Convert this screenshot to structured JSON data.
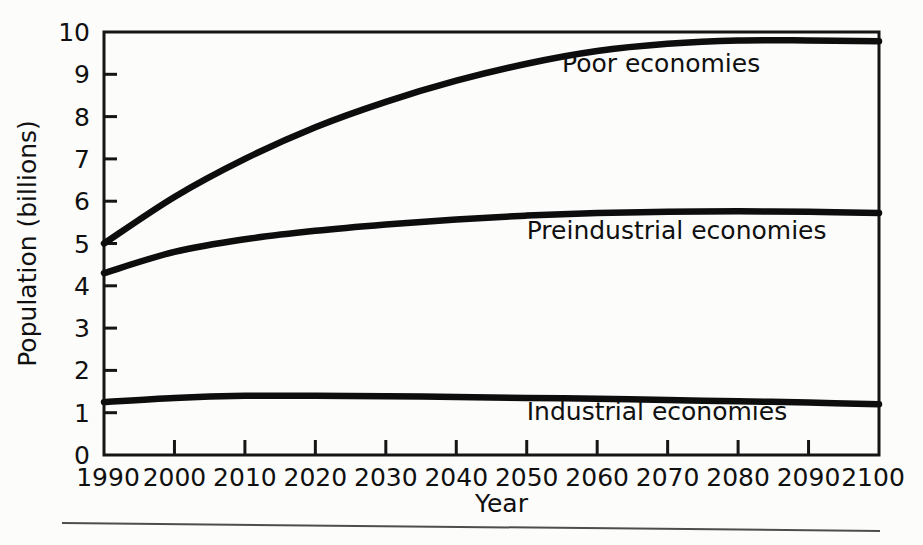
{
  "chart_data": {
    "type": "line",
    "title": "",
    "xlabel": "Year",
    "ylabel": "Population (billions)",
    "xlim": [
      1990,
      2100
    ],
    "ylim": [
      0,
      10
    ],
    "grid": false,
    "legend_position": "inline-right",
    "x_ticks": [
      "1990",
      "2000",
      "2010",
      "2020",
      "2030",
      "2040",
      "2050",
      "2060",
      "2070",
      "2080",
      "2090",
      "2100"
    ],
    "y_ticks": [
      "0",
      "1",
      "2",
      "3",
      "4",
      "5",
      "6",
      "7",
      "8",
      "9",
      "10"
    ],
    "x": [
      1990,
      2000,
      2010,
      2020,
      2030,
      2040,
      2050,
      2060,
      2070,
      2080,
      2090,
      2100
    ],
    "series": [
      {
        "name": "Poor economies",
        "values": [
          5.0,
          6.1,
          7.0,
          7.75,
          8.35,
          8.85,
          9.25,
          9.55,
          9.72,
          9.8,
          9.8,
          9.78
        ]
      },
      {
        "name": "Preindustrial economies",
        "values": [
          4.3,
          4.8,
          5.1,
          5.3,
          5.45,
          5.57,
          5.66,
          5.72,
          5.75,
          5.76,
          5.75,
          5.72
        ]
      },
      {
        "name": "Industrial economies",
        "values": [
          1.25,
          1.35,
          1.4,
          1.4,
          1.39,
          1.37,
          1.35,
          1.33,
          1.3,
          1.27,
          1.24,
          1.2
        ]
      }
    ],
    "colors": {
      "line": "#0d0d0d",
      "axis": "#151515",
      "background": "#fcfcfb"
    },
    "annotations": [
      {
        "text": "Poor economies",
        "x": 2055,
        "y": 9.05
      },
      {
        "text": "Preindustrial economies",
        "x": 2050,
        "y": 5.1
      },
      {
        "text": "Industrial economies",
        "x": 2050,
        "y": 0.82
      }
    ]
  }
}
